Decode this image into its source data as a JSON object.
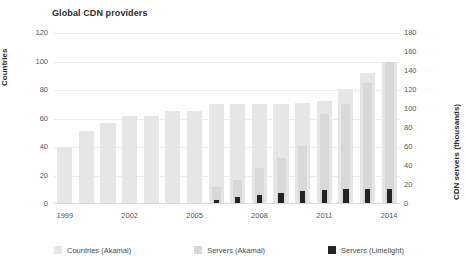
{
  "chart_data": {
    "type": "bar",
    "title": "Global CDN providers",
    "xlabel": "",
    "ylabel": "Countries",
    "y2label": "CDN servers (thousands)",
    "grid": true,
    "legend_position": "bottom",
    "ylim": [
      0,
      120
    ],
    "y2lim": [
      0,
      180
    ],
    "yticks": [
      "0",
      "20",
      "40",
      "60",
      "80",
      "100",
      "120"
    ],
    "y2ticks": [
      "0",
      "20",
      "40",
      "60",
      "80",
      "100",
      "120",
      "140",
      "160",
      "180"
    ],
    "x": [
      "1999",
      "2000",
      "2001",
      "2002",
      "2003",
      "2004",
      "2005",
      "2006",
      "2007",
      "2008",
      "2009",
      "2010",
      "2011",
      "2012",
      "2013",
      "2014"
    ],
    "xtick_labels": [
      "1999",
      "2002",
      "2005",
      "2008",
      "2011",
      "2014"
    ],
    "xtick_years": [
      "1999",
      "2002",
      "2005",
      "2008",
      "2011",
      "2014"
    ],
    "series": [
      {
        "name": "Countries (Akamai)",
        "axis": "left",
        "color": "#e6e6e6",
        "values": [
          40,
          51,
          57,
          62,
          62,
          65,
          65,
          70,
          70,
          70,
          70,
          71,
          72,
          81,
          92,
          100
        ]
      },
      {
        "name": "Servers (Akamai)",
        "axis": "right",
        "color": "#d8d8d8",
        "values": [
          0,
          0,
          0,
          0,
          0,
          0,
          0,
          18,
          25,
          38,
          48,
          61,
          95,
          105,
          127,
          150
        ]
      },
      {
        "name": "Servers (Limelight)",
        "axis": "right",
        "color": "#232323",
        "values": [
          0,
          0,
          0,
          0,
          0,
          0,
          0,
          4,
          7,
          9,
          12,
          14,
          15,
          16,
          16,
          16
        ]
      }
    ],
    "annotation_peak_value": "170"
  },
  "legend": {
    "items": [
      {
        "label": "Countries (Akamai)",
        "color": "#e6e6e6",
        "icon": "square-swatch-icon"
      },
      {
        "label": "Servers (Akamai)",
        "color": "#d8d8d8",
        "icon": "square-swatch-icon"
      },
      {
        "label": "Servers (Limelight)",
        "color": "#232323",
        "icon": "square-swatch-icon"
      }
    ]
  }
}
